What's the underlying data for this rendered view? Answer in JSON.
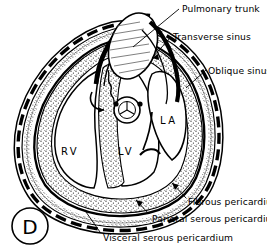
{
  "figure": {
    "panel_letter": "D",
    "background_color": "#ffffff",
    "ink_color": "#000000",
    "width": 267,
    "height": 250
  },
  "labels": {
    "pulmonary_trunk": "Pulmonary trunk",
    "transverse_sinus": "Transverse sinus",
    "oblique_sinus": "Oblique sinus",
    "fibrous_pericardium": "Fibrous pericardium",
    "parietal_serous_pericardium": "Parietal serous pericardium",
    "visceral_serous_pericardium": "Visceral serous pericardium"
  },
  "chambers": {
    "right_ventricle": "RV",
    "left_ventricle": "LV",
    "left_atrium": "LA"
  },
  "structures": {
    "pulmonary_trunk_vessel": "pulmonary-trunk-vessel",
    "vessel_cross_section": "vessel-cross-section",
    "myocardium": "myocardium-stipple",
    "pericardial_cavity": "pericardial-cavity",
    "interventricular_septum": "interventricular-septum",
    "mitral_valve_leaflet": "mitral-valve-leaflet"
  }
}
